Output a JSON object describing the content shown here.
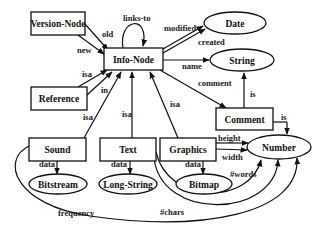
{
  "diagram": {
    "nodes": {
      "version_node": "Version-Node",
      "info_node": "Info-Node",
      "date": "Date",
      "string": "String",
      "reference": "Reference",
      "comment": "Comment",
      "sound": "Sound",
      "text": "Text",
      "graphics": "Graphics",
      "number": "Number",
      "bitstream": "Bitstream",
      "long_string": "Long-String",
      "bitmap": "Bitmap"
    },
    "edges": {
      "links_to": "links-to",
      "old": "old",
      "new": "new",
      "modified": "modified",
      "created": "created",
      "name": "name",
      "comment": "comment",
      "isa_reference": "isa",
      "in": "in",
      "isa_sound": "isa",
      "isa_text": "isa",
      "isa_graphics": "isa",
      "is_comment_string": "is",
      "is_comment_number": "is",
      "height": "height",
      "width": "width",
      "data_sound": "data",
      "data_text": "data",
      "data_graphics": "data",
      "words": "#words",
      "chars": "#chars",
      "frequency": "frequency"
    }
  }
}
